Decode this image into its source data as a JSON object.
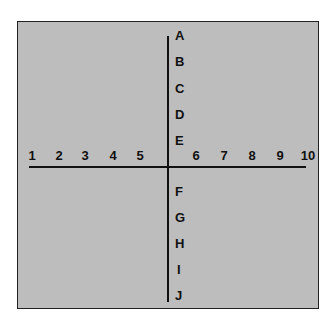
{
  "diagram": {
    "x_axis_labels": [
      "1",
      "2",
      "3",
      "4",
      "5",
      "6",
      "7",
      "8",
      "9",
      "10"
    ],
    "y_axis_labels": [
      "A",
      "B",
      "C",
      "D",
      "E",
      "F",
      "G",
      "H",
      "I",
      "J"
    ]
  }
}
